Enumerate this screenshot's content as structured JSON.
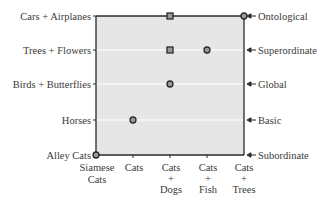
{
  "chart_data": {
    "type": "scatter",
    "title": "",
    "xlabel": "",
    "ylabel": "",
    "grid": true,
    "plot_background": "#e6e6e6",
    "x_categories": [
      [
        "Siamese",
        "Cats"
      ],
      [
        "Cats"
      ],
      [
        "Cats",
        "+",
        "Dogs"
      ],
      [
        "Cats",
        "+",
        "Fish"
      ],
      [
        "Cats",
        "+",
        "Trees"
      ]
    ],
    "y_categories_left": [
      "Alley Cats",
      "Horses",
      "Birds + Butterflies",
      "Trees + Flowers",
      "Cars + Airplanes"
    ],
    "y_categories_right": [
      "Subordinate",
      "Basic",
      "Global",
      "Superordinate",
      "Ontological"
    ],
    "series": [
      {
        "name": "circle",
        "marker": "circle",
        "points": [
          {
            "x": "Siamese Cats",
            "y": "Subordinate"
          },
          {
            "x": "Cats",
            "y": "Basic"
          },
          {
            "x": "Cats + Dogs",
            "y": "Global"
          },
          {
            "x": "Cats + Fish",
            "y": "Superordinate"
          },
          {
            "x": "Cats + Trees",
            "y": "Ontological"
          }
        ]
      },
      {
        "name": "square",
        "marker": "square",
        "points": [
          {
            "x": "Cats + Dogs",
            "y": "Superordinate"
          },
          {
            "x": "Cats + Dogs",
            "y": "Ontological"
          }
        ]
      }
    ],
    "point_indices": {
      "circle": [
        [
          0,
          0
        ],
        [
          1,
          1
        ],
        [
          2,
          2
        ],
        [
          3,
          3
        ],
        [
          4,
          4
        ]
      ],
      "square": [
        [
          2,
          3
        ],
        [
          2,
          4
        ]
      ]
    }
  },
  "labels": {
    "left": {
      "l0": "Alley Cats",
      "l1": "Horses",
      "l2": "Birds + Butterflies",
      "l3": "Trees + Flowers",
      "l4": "Cars + Airplanes"
    },
    "right": {
      "r0": "Subordinate",
      "r1": "Basic",
      "r2": "Global",
      "r3": "Superordinate",
      "r4": "Ontological"
    },
    "bottom": {
      "b0a": "Siamese",
      "b0b": "Cats",
      "b1a": "Cats",
      "b2a": "Cats",
      "b2b": "+",
      "b2c": "Dogs",
      "b3a": "Cats",
      "b3b": "+",
      "b3c": "Fish",
      "b4a": "Cats",
      "b4b": "+",
      "b4c": "Trees"
    }
  }
}
